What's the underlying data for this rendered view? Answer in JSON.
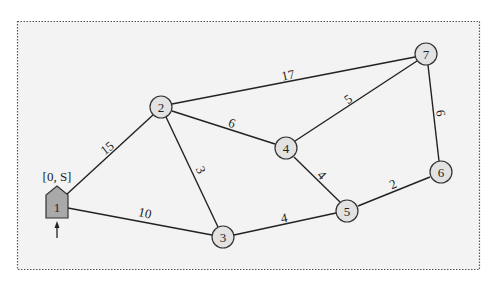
{
  "diagram": {
    "type": "weighted-graph",
    "start_label": "[0, S]",
    "nodes": [
      {
        "id": "1",
        "label": "1",
        "x": 57,
        "y": 203,
        "shape": "pentagon",
        "fill": "#a9a9a9"
      },
      {
        "id": "2",
        "label": "2",
        "x": 161,
        "y": 107,
        "shape": "circle",
        "fill": "#e2e2e2"
      },
      {
        "id": "3",
        "label": "3",
        "x": 223,
        "y": 237,
        "shape": "circle",
        "fill": "#e2e2e2"
      },
      {
        "id": "4",
        "label": "4",
        "x": 286,
        "y": 148,
        "shape": "circle",
        "fill": "#e2e2e2"
      },
      {
        "id": "5",
        "label": "5",
        "x": 347,
        "y": 211,
        "shape": "circle",
        "fill": "#e2e2e2"
      },
      {
        "id": "6",
        "label": "6",
        "x": 441,
        "y": 172,
        "shape": "circle",
        "fill": "#e2e2e2"
      },
      {
        "id": "7",
        "label": "7",
        "x": 426,
        "y": 54,
        "shape": "circle",
        "fill": "#e2e2e2"
      }
    ],
    "edges": [
      {
        "from": "1",
        "to": "2",
        "weight": "15",
        "lx": 107,
        "ly": 148,
        "rot": -38
      },
      {
        "from": "1",
        "to": "3",
        "weight": "10",
        "lx": 145,
        "ly": 213,
        "rot": 14
      },
      {
        "from": "2",
        "to": "3",
        "weight": "3",
        "lx": 201,
        "ly": 170,
        "rot": 66
      },
      {
        "from": "2",
        "to": "4",
        "weight": "6",
        "lx": 232,
        "ly": 123,
        "rot": 18
      },
      {
        "from": "2",
        "to": "7",
        "weight": "17",
        "lx": 288,
        "ly": 75,
        "rot": -12
      },
      {
        "from": "4",
        "to": "7",
        "weight": "5",
        "lx": 348,
        "ly": 99,
        "rot": -35
      },
      {
        "from": "4",
        "to": "5",
        "weight": "4",
        "lx": 322,
        "ly": 175,
        "rot": 46
      },
      {
        "from": "3",
        "to": "5",
        "weight": "4",
        "lx": 284,
        "ly": 218,
        "rot": -12
      },
      {
        "from": "5",
        "to": "6",
        "weight": "2",
        "lx": 393,
        "ly": 184,
        "rot": -24
      },
      {
        "from": "7",
        "to": "6",
        "weight": "6",
        "lx": 441,
        "ly": 113,
        "rot": 82
      }
    ]
  }
}
